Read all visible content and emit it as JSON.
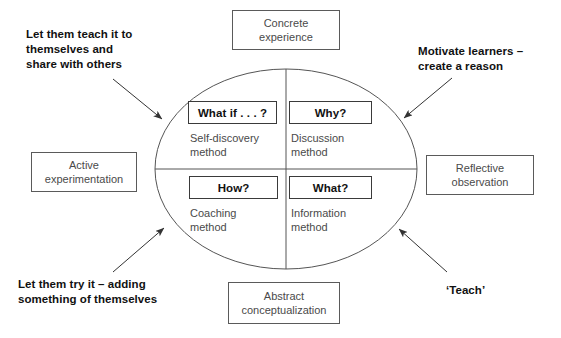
{
  "diagram": {
    "colors": {
      "ellipse_stroke": "#555555",
      "box_stroke": "#5a5a5a",
      "inner_box_stroke": "#3a3a3a",
      "arrow": "#333333",
      "bold_text": "#111111",
      "muted_text": "#4a4a4a",
      "background": "#ffffff"
    },
    "stage_boxes": [
      {
        "id": "concrete",
        "label": "Concrete\nexperience",
        "position": "top"
      },
      {
        "id": "reflective",
        "label": "Reflective\nobservation",
        "position": "right"
      },
      {
        "id": "abstract",
        "label": "Abstract\nconceptualization",
        "position": "bottom"
      },
      {
        "id": "active",
        "label": "Active\nexperimentation",
        "position": "left"
      }
    ],
    "quadrants": [
      {
        "id": "top-left",
        "question": "What if . . . ?",
        "method": "Self-discovery\nmethod"
      },
      {
        "id": "top-right",
        "question": "Why?",
        "method": "Discussion\nmethod"
      },
      {
        "id": "bottom-left",
        "question": "How?",
        "method": "Coaching\nmethod"
      },
      {
        "id": "bottom-right",
        "question": "What?",
        "method": "Information\nmethod"
      }
    ],
    "callouts": [
      {
        "id": "teach-themselves",
        "text": "Let them teach it to\nthemselves and\nshare with others",
        "points_to": "top-left"
      },
      {
        "id": "motivate",
        "text": "Motivate learners –\ncreate a reason",
        "points_to": "top-right"
      },
      {
        "id": "try-it",
        "text": "Let them try it – adding\nsomething of themselves",
        "points_to": "bottom-left"
      },
      {
        "id": "teach",
        "text": "‘Teach’",
        "points_to": "bottom-right"
      }
    ]
  }
}
